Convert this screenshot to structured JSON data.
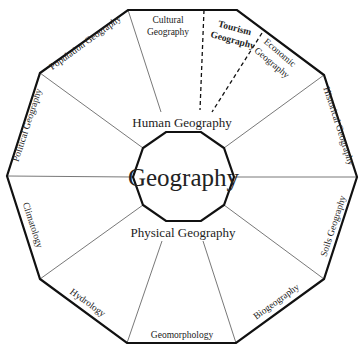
{
  "diagram": {
    "center": {
      "label": "Geography"
    },
    "branches": {
      "human": {
        "label": "Human Geography"
      },
      "physical": {
        "label": "Physical Geography"
      }
    },
    "segments": {
      "cultural": {
        "line1": "Cultural",
        "line2": "Geography"
      },
      "tourism": {
        "line1": "Tourism",
        "line2": "Geography",
        "emphasized": true
      },
      "economic": {
        "line1": "Economic",
        "line2": "Geography"
      },
      "historical": {
        "label": "Historical Geography"
      },
      "soils": {
        "label": "Soils Geography"
      },
      "biogeography": {
        "label": "Biogeography"
      },
      "geomorphology": {
        "label": "Geomorphology"
      },
      "hydrology": {
        "label": "Hydrology"
      },
      "climatology": {
        "label": "Climatology"
      },
      "political": {
        "label": "Political Geography"
      },
      "population": {
        "label": "Population Geography"
      }
    },
    "colors": {
      "stroke": "#111111",
      "thin_line": "#555555",
      "text": "#222222",
      "background": "#ffffff"
    }
  }
}
